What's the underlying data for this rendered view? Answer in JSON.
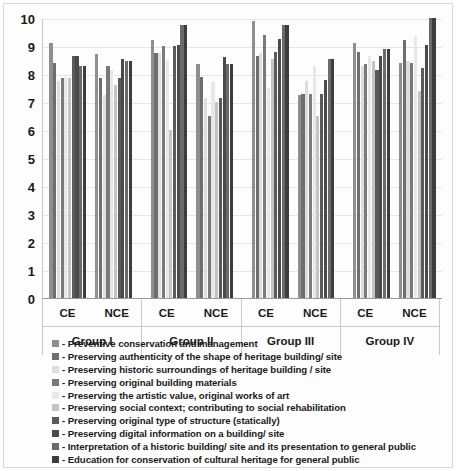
{
  "chart_data": {
    "type": "bar",
    "title": "",
    "xlabel": "",
    "ylabel": "",
    "ylim": [
      0,
      10
    ],
    "yticks": [
      0,
      1,
      2,
      3,
      4,
      5,
      6,
      7,
      8,
      9,
      10
    ],
    "grid": true,
    "legend_position": "below",
    "group_labels": [
      "Group I",
      "Group II",
      "Group III",
      "Group IV"
    ],
    "sub_labels": [
      "CE",
      "NCE"
    ],
    "categories": [
      "Group I / CE",
      "Group I / NCE",
      "Group II / CE",
      "Group II / NCE",
      "Group III / CE",
      "Group III / NCE",
      "Group IV / CE",
      "Group IV / NCE"
    ],
    "series": [
      {
        "name": "Preventive conservation and management",
        "color": "#8f8f8f",
        "values": [
          9.1,
          8.7,
          9.2,
          8.35,
          9.9,
          7.25,
          9.1,
          8.4
        ]
      },
      {
        "name": "Preserving authenticity of the shape of heritage building/ site",
        "color": "#6e6e6e",
        "values": [
          8.4,
          7.85,
          8.75,
          7.9,
          8.65,
          7.3,
          8.8,
          9.2
        ]
      },
      {
        "name": "Preserving historic surroundings of heritage building / site",
        "color": "#dedede",
        "values": [
          7.75,
          7.25,
          8.75,
          7.15,
          8.75,
          7.75,
          8.3,
          8.45
        ]
      },
      {
        "name": "Preserving original building materials",
        "color": "#7a7a7a",
        "values": [
          7.85,
          8.3,
          9.0,
          6.5,
          9.4,
          7.3,
          8.35,
          8.4
        ]
      },
      {
        "name": "Preserving the artistic value, original works of art",
        "color": "#e8e8e8",
        "values": [
          7.9,
          8.15,
          8.5,
          7.7,
          7.5,
          8.3,
          8.65,
          9.35
        ]
      },
      {
        "name": "Preserving social context; contributing to social rehabilitation",
        "color": "#c4c4c4",
        "values": [
          7.85,
          7.6,
          6.0,
          7.0,
          8.55,
          6.5,
          8.45,
          7.4
        ]
      },
      {
        "name": "Preserving original type of structure (statically)",
        "color": "#5a5a5a",
        "values": [
          8.65,
          7.85,
          9.0,
          7.15,
          8.8,
          7.3,
          8.15,
          8.2
        ]
      },
      {
        "name": "Preserving digital information on a building/ site",
        "color": "#4a4a4a",
        "values": [
          8.65,
          8.55,
          9.05,
          8.6,
          9.25,
          7.8,
          8.65,
          9.05
        ]
      },
      {
        "name": "Interpretation of a historic building/ site and its presentation to general public",
        "color": "#6a6a6a",
        "values": [
          8.3,
          8.45,
          9.75,
          8.35,
          9.75,
          8.55,
          8.9,
          10.0
        ]
      },
      {
        "name": "Education for conservation of cultural heritage for general public",
        "color": "#3d3d3d",
        "values": [
          8.3,
          8.45,
          9.75,
          8.35,
          9.75,
          8.55,
          8.9,
          10.0
        ]
      }
    ]
  },
  "axis": {
    "y_tick_10": "10",
    "y_tick_9": "9",
    "y_tick_8": "8",
    "y_tick_7": "7",
    "y_tick_6": "6",
    "y_tick_5": "5",
    "y_tick_4": "4",
    "y_tick_3": "3",
    "y_tick_2": "2",
    "y_tick_1": "1",
    "y_tick_0": "0"
  },
  "xaxis": {
    "groups": [
      {
        "label": "Group I",
        "subs": [
          "CE",
          "NCE"
        ]
      },
      {
        "label": "Group II",
        "subs": [
          "CE",
          "NCE"
        ]
      },
      {
        "label": "Group III",
        "subs": [
          "CE",
          "NCE"
        ]
      },
      {
        "label": "Group IV",
        "subs": [
          "CE",
          "NCE"
        ]
      }
    ]
  },
  "legend": {
    "items": [
      {
        "marker": "legend-swatch-1",
        "label": "- Preventive conservation and management"
      },
      {
        "marker": "legend-swatch-2",
        "label": "- Preserving authenticity of the shape of heritage building/ site"
      },
      {
        "marker": "legend-swatch-3",
        "label": "- Preserving historic surroundings of heritage building / site"
      },
      {
        "marker": "legend-swatch-4",
        "label": "- Preserving original building materials"
      },
      {
        "marker": "legend-swatch-5",
        "label": "- Preserving the artistic value, original works of art"
      },
      {
        "marker": "legend-swatch-6",
        "label": "- Preserving social context; contributing to social rehabilitation"
      },
      {
        "marker": "legend-swatch-7",
        "label": "- Preserving original type of structure (statically)"
      },
      {
        "marker": "legend-swatch-8",
        "label": "- Preserving digital information on a building/ site"
      },
      {
        "marker": "legend-swatch-9",
        "label": "- Interpretation of a historic building/ site and its presentation to general public"
      },
      {
        "marker": "legend-swatch-10",
        "label": "- Education for conservation of cultural heritage for general public"
      }
    ]
  }
}
